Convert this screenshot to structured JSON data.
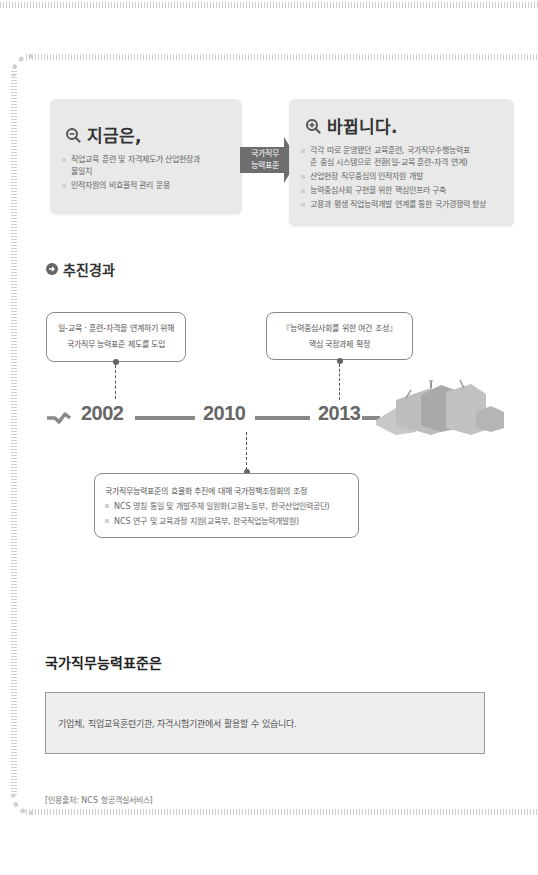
{
  "panels": {
    "now": {
      "icon": "zoom-out-icon",
      "title": "지금은,",
      "items": [
        "직업교육 훈련 및 자격제도가 산업현장과",
        "불일치",
        "인적자원의 비효율적 관리 운용"
      ]
    },
    "arrow": {
      "line1": "국가직무",
      "line2": "능력표준"
    },
    "change": {
      "icon": "zoom-in-icon",
      "title": "바뀝니다.",
      "items": [
        "각각 따로 운영됐던 교육훈련, 국가직무수행능력표",
        "준 중심 시스템으로 전환(일-교육 훈련-자격 연계)",
        "산업현장 직무중심의 인적자원 개발",
        "능력중심사회 구현을 위한 핵심인프라 구축",
        "고용과 평생 직업능력개발 연계를 통한 국가경쟁력 향상"
      ]
    }
  },
  "progress": {
    "title": "추진경과",
    "events": [
      {
        "year": "2002",
        "lines": [
          "일-교육 · 훈련-자격을 연계하기 위해",
          "국가직무 능력표준 제도를 도입"
        ]
      },
      {
        "year": "2010",
        "lines": [
          "국가직무능력표준의 효율화 추진에 대해 국가정책조정회의 조정",
          "NCS 명칭 통일 및 개발주체 일원화(고용노동부, 한국산업인력공단)",
          "NCS 연구 및 교육과정 지원(교육부, 한국직업능력개발원)"
        ]
      },
      {
        "year": "2013",
        "lines": [
          "『능력중심사회를 위한 여건 조성』",
          "핵심 국정과제 확정"
        ]
      }
    ]
  },
  "ncs": {
    "heading": "국가직무능력표준은",
    "note": "기업체, 직업교육훈련기관, 자격시험기관에서 활용할 수 있습니다."
  },
  "source": "[인용출처: NCS 항공객실서비스]",
  "colors": {
    "panel_bg": "#e9e9e9",
    "arrow": "#6e6e6e",
    "timeline": "#888888",
    "note_bg": "#eeeeee"
  }
}
